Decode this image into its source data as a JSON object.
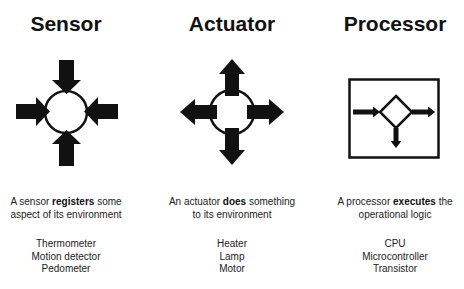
{
  "columns": [
    {
      "id": "sensor",
      "title": "Sensor",
      "icon": "inward-arrows-circle-icon",
      "description": {
        "prefix": "A sensor ",
        "emphasis": "registers",
        "suffix_line1": " some",
        "line2": "aspect of its environment"
      },
      "examples": [
        "Thermometer",
        "Motion detector",
        "Pedometer"
      ]
    },
    {
      "id": "actuator",
      "title": "Actuator",
      "icon": "outward-arrows-circle-icon",
      "description": {
        "prefix": "An actuator ",
        "emphasis": "does",
        "suffix_line1": " something",
        "line2": "to its environment"
      },
      "examples": [
        "Heater",
        "Lamp",
        "Motor"
      ]
    },
    {
      "id": "processor",
      "title": "Processor",
      "icon": "decision-diamond-box-icon",
      "description": {
        "prefix": "A processor ",
        "emphasis": "executes",
        "suffix_line1": " the",
        "line2": "operational logic"
      },
      "examples": [
        "CPU",
        "Microcontroller",
        "Transistor"
      ]
    }
  ],
  "colors": {
    "background": "#ffffff",
    "ink": "#111111",
    "text": "#222222"
  }
}
